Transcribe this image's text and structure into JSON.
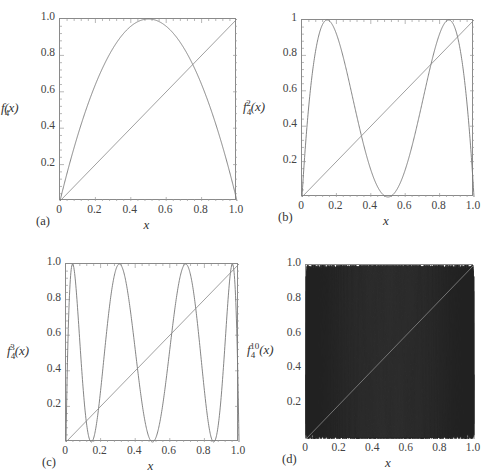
{
  "figure": {
    "panels": [
      {
        "id": "a",
        "panel_label": "(a)",
        "ylabel_base": "f",
        "ylabel_sub": "4",
        "ylabel_sup": "",
        "ylabel_arg": "(x)",
        "xlabel": "x",
        "xticks": [
          "0",
          "0.2",
          "0.4",
          "0.6",
          "0.8",
          "1.0"
        ],
        "yticks": [
          "0.2",
          "0.4",
          "0.6",
          "0.8",
          "1.0"
        ]
      },
      {
        "id": "b",
        "panel_label": "(b)",
        "ylabel_base": "f",
        "ylabel_sub": "4",
        "ylabel_sup": "2",
        "ylabel_arg": "(x)",
        "xlabel": "x",
        "xticks": [
          "0",
          "0.2",
          "0.4",
          "0.6",
          "0.8",
          "1.0"
        ],
        "yticks": [
          "0.2",
          "0.4",
          "0.6",
          "0.8",
          "1"
        ]
      },
      {
        "id": "c",
        "panel_label": "(c)",
        "ylabel_base": "f",
        "ylabel_sub": "4",
        "ylabel_sup": "3",
        "ylabel_arg": "(x)",
        "xlabel": "x",
        "xticks": [
          "0",
          "0.2",
          "0.4",
          "0.6",
          "0.8",
          "1.0"
        ],
        "yticks": [
          "0.2",
          "0.4",
          "0.6",
          "0.8",
          "1.0"
        ]
      },
      {
        "id": "d",
        "panel_label": "(d)",
        "ylabel_base": "f",
        "ylabel_sub": "4",
        "ylabel_sup": "10",
        "ylabel_arg": "(x)",
        "xlabel": "x",
        "xticks": [
          "0",
          "0.2",
          "0.4",
          "0.6",
          "0.8",
          "1.0"
        ],
        "yticks": [
          "0.2",
          "0.4",
          "0.6",
          "0.8",
          "1.0"
        ]
      }
    ]
  },
  "chart_data": [
    {
      "type": "line",
      "panel": "(a)",
      "title": "",
      "xlabel": "x",
      "ylabel": "f4(x)",
      "xlim": [
        0,
        1
      ],
      "ylim": [
        0,
        1
      ],
      "grid": false,
      "series": [
        {
          "name": "f4(x) = 4x(1-x)",
          "iterate": 1,
          "r": 4,
          "x": [
            0,
            0.1,
            0.2,
            0.3,
            0.4,
            0.5,
            0.6,
            0.7,
            0.8,
            0.9,
            1.0
          ],
          "y": [
            0,
            0.36,
            0.64,
            0.84,
            0.96,
            1.0,
            0.96,
            0.84,
            0.64,
            0.36,
            0
          ]
        },
        {
          "name": "y = x",
          "x": [
            0,
            1
          ],
          "y": [
            0,
            1
          ]
        }
      ],
      "color": "#777777"
    },
    {
      "type": "line",
      "panel": "(b)",
      "title": "",
      "xlabel": "x",
      "ylabel": "f4^2(x)",
      "xlim": [
        0,
        1
      ],
      "ylim": [
        0,
        1
      ],
      "grid": false,
      "series": [
        {
          "name": "f4^2(x)",
          "iterate": 2,
          "r": 4,
          "maxima_x": [
            0.146,
            0.854
          ],
          "minima_x": [
            0,
            0.5,
            1.0
          ]
        },
        {
          "name": "y = x",
          "x": [
            0,
            1
          ],
          "y": [
            0,
            1
          ]
        }
      ],
      "color": "#777777"
    },
    {
      "type": "line",
      "panel": "(c)",
      "title": "",
      "xlabel": "x",
      "ylabel": "f4^3(x)",
      "xlim": [
        0,
        1
      ],
      "ylim": [
        0,
        1
      ],
      "grid": false,
      "series": [
        {
          "name": "f4^3(x)",
          "iterate": 3,
          "r": 4,
          "maxima_x": [
            0.038,
            0.309,
            0.691,
            0.962
          ],
          "minima_x": [
            0,
            0.146,
            0.5,
            0.854,
            1.0
          ]
        },
        {
          "name": "y = x",
          "x": [
            0,
            1
          ],
          "y": [
            0,
            1
          ]
        }
      ],
      "color": "#777777"
    },
    {
      "type": "line",
      "panel": "(d)",
      "title": "",
      "xlabel": "x",
      "ylabel": "f4^10(x)",
      "xlim": [
        0,
        1
      ],
      "ylim": [
        0,
        1
      ],
      "grid": false,
      "series": [
        {
          "name": "f4^10(x)",
          "iterate": 10,
          "r": 4,
          "note": "512 oscillations, densely filled"
        },
        {
          "name": "y = x",
          "x": [
            0,
            1
          ],
          "y": [
            0,
            1
          ]
        }
      ],
      "color": "#222222"
    }
  ],
  "layout": {
    "frames": [
      {
        "left": 59,
        "top": 18,
        "width": 177,
        "height": 182
      },
      {
        "left": 301,
        "top": 19,
        "width": 172,
        "height": 177
      },
      {
        "left": 65,
        "top": 263,
        "width": 173,
        "height": 178
      },
      {
        "left": 305,
        "top": 264,
        "width": 168,
        "height": 174
      }
    ]
  }
}
